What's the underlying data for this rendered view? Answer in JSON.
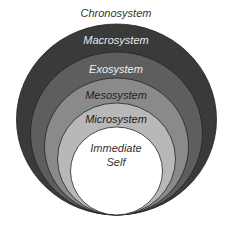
{
  "diagram": {
    "title_label": "Chronosystem",
    "layers": [
      {
        "label": "Macrosystem",
        "fill": "#3a3a3a",
        "text_color": "#e8e8e8"
      },
      {
        "label": "Exosystem",
        "fill": "#5e5e5e",
        "text_color": "#eeeeee"
      },
      {
        "label": "Mesosystem",
        "fill": "#8a8a8a",
        "text_color": "#222222"
      },
      {
        "label": "Microsystem",
        "fill": "#b8b8b8",
        "text_color": "#222222"
      },
      {
        "label_line1": "Immediate",
        "label_line2": "Self",
        "fill": "#ffffff",
        "text_color": "#333333"
      }
    ]
  }
}
